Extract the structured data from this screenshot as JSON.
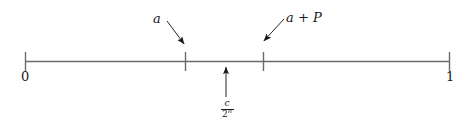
{
  "figure": {
    "type": "number-line-diagram",
    "axis": {
      "left_endpoint_label": "0",
      "right_endpoint_label": "1",
      "line_color": "#555555",
      "tick_color": "#555555",
      "left_value": 0,
      "right_value": 1
    },
    "interior_ticks": [
      {
        "label": "a",
        "position_fraction": 0.376
      },
      {
        "label": "a + P",
        "position_fraction": 0.56
      }
    ],
    "annotations": {
      "a_label": "a",
      "a_plus_p_label": "a + P",
      "point_label": {
        "numerator": "c",
        "denominator_base": "2",
        "denominator_exponent": "n"
      }
    },
    "arrow_color": "#1a1a1a",
    "background_color": "#ffffff"
  }
}
